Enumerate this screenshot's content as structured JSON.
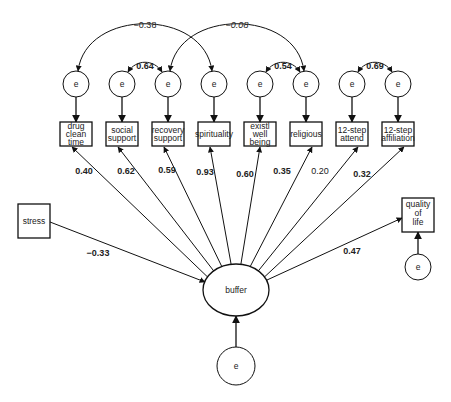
{
  "diagram": {
    "type": "structural-equation-model",
    "colors": {
      "stroke": "#111111",
      "text": "#222222",
      "background": "#ffffff"
    },
    "indicators": [
      {
        "id": "drug",
        "lines": [
          "drug",
          "clean",
          "time"
        ],
        "loading": "0.40",
        "bold": true
      },
      {
        "id": "social",
        "lines": [
          "social",
          "support"
        ],
        "loading": "0.62",
        "bold": true
      },
      {
        "id": "recovery",
        "lines": [
          "recovery",
          "support"
        ],
        "loading": "0.59",
        "bold": true
      },
      {
        "id": "spirituality",
        "lines": [
          "spirituality"
        ],
        "loading": "0.93",
        "bold": true
      },
      {
        "id": "existl",
        "lines": [
          "existl",
          "well",
          "being"
        ],
        "loading": "0.60",
        "bold": true
      },
      {
        "id": "religious",
        "lines": [
          "religious"
        ],
        "loading": "0.35",
        "bold": true
      },
      {
        "id": "attend",
        "lines": [
          "12-step",
          "attend"
        ],
        "loading": "0.20",
        "bold": false
      },
      {
        "id": "affiliation",
        "lines": [
          "12-step",
          "affiliation"
        ],
        "loading": "0.32",
        "bold": true
      }
    ],
    "error_label": "e",
    "error_covariances": [
      {
        "from": 0,
        "to": 3,
        "value": "−0.38",
        "style": "normal",
        "big": true
      },
      {
        "from": 2,
        "to": 5,
        "value": "−0.08",
        "style": "italic",
        "big": true
      },
      {
        "from": 1,
        "to": 2,
        "value": "0.64",
        "style": "bold",
        "big": false
      },
      {
        "from": 4,
        "to": 5,
        "value": "0.54",
        "style": "bold",
        "big": false
      },
      {
        "from": 6,
        "to": 7,
        "value": "0.69",
        "style": "bold",
        "big": false
      }
    ],
    "latent": {
      "label": "buffer"
    },
    "predictor": {
      "label": "stress",
      "path": "−0.33"
    },
    "outcome": {
      "lines": [
        "quality",
        "of",
        "life"
      ],
      "path": "0.47"
    }
  }
}
